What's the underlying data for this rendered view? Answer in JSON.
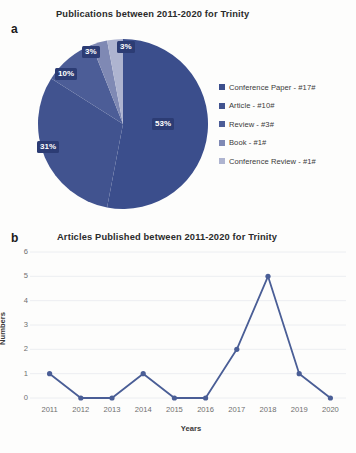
{
  "figure": {
    "panel_a_letter": "a",
    "panel_b_letter": "b"
  },
  "colors": {
    "conference_paper": "#3b4e8c",
    "article": "#41538f",
    "review": "#4c5d97",
    "book": "#7f89b4",
    "conference_review": "#aeb4d0",
    "line": "#4a5e96",
    "label_box": "#2c3c74",
    "gridline": "#eceef1",
    "axis_text": "#6f6f6f",
    "background": "#fdfdfc"
  },
  "chart_data": [
    {
      "type": "pie",
      "title": "Publications between 2011-2020 for Trinity",
      "xlabel": "",
      "ylabel": "",
      "legend_position": "right",
      "grid": false,
      "categories": [
        "Conference Paper",
        "Article",
        "Review",
        "Book",
        "Conference Review"
      ],
      "legend_entries": [
        "Conference Paper - #17#",
        "Article - #10#",
        "Review - #3#",
        "Book - #1#",
        "Conference Review - #1#"
      ],
      "counts": [
        17,
        10,
        3,
        1,
        1
      ],
      "values": [
        53,
        31,
        10,
        3,
        3
      ],
      "data_labels": [
        "53%",
        "31%",
        "10%",
        "3%",
        "3%"
      ]
    },
    {
      "type": "line",
      "title": "Articles Published between 2011-2020 for Trinity",
      "xlabel": "Years",
      "ylabel": "Numbers",
      "grid": true,
      "legend_position": "none",
      "categories": [
        "2011",
        "2012",
        "2013",
        "2014",
        "2015",
        "2016",
        "2017",
        "2018",
        "2019",
        "2020"
      ],
      "values": [
        1,
        0,
        0,
        1,
        0,
        0,
        2,
        5,
        1,
        0
      ],
      "ylim": [
        0,
        6
      ],
      "yticks": [
        "0",
        "1",
        "2",
        "3",
        "4",
        "5",
        "6"
      ]
    }
  ]
}
